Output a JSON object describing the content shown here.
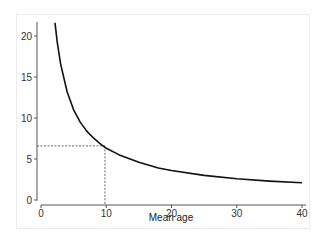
{
  "chart_data": {
    "type": "line",
    "title": "",
    "xlabel": "Mean age",
    "ylabel": "",
    "xlim": [
      0,
      40
    ],
    "ylim": [
      0,
      21.7
    ],
    "grid": false,
    "legend": null,
    "x_ticks": [
      0,
      10,
      20,
      30,
      40
    ],
    "y_ticks": [
      0,
      5,
      10,
      15,
      20
    ],
    "series": [
      {
        "name": "curve",
        "color": "#111111",
        "x": [
          2.15,
          2.5,
          3,
          4,
          5,
          6,
          7,
          8,
          9,
          10,
          12,
          15,
          18,
          20,
          25,
          30,
          35,
          40
        ],
        "values": [
          21.6,
          19.2,
          16.6,
          13.2,
          11.0,
          9.5,
          8.4,
          7.6,
          6.9,
          6.3,
          5.5,
          4.6,
          3.9,
          3.6,
          3.0,
          2.6,
          2.3,
          2.1
        ]
      }
    ],
    "annotations": [
      {
        "type": "reference-line",
        "style": "dashed",
        "orientation": "vertical",
        "x": 9.8,
        "from_y": 0,
        "to_y": 6.6
      },
      {
        "type": "reference-line",
        "style": "dashed",
        "orientation": "horizontal",
        "y": 6.6,
        "from_x": 0,
        "to_x": 9.8
      }
    ]
  },
  "axes": {
    "x_tick_labels": [
      "0",
      "10",
      "20",
      "30",
      "40"
    ],
    "y_tick_labels": [
      "0",
      "5",
      "10",
      "15",
      "20"
    ],
    "x_title": "Mean age"
  }
}
